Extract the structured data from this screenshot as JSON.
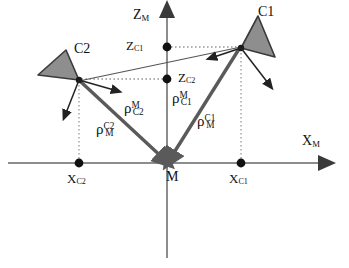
{
  "figure": {
    "type": "geometry-diagram",
    "axes": {
      "vertical_label": "Z",
      "vertical_sub": "M",
      "horizontal_label": "X",
      "horizontal_sub": "M"
    },
    "points": {
      "origin": "M",
      "z_c1": {
        "base": "Z",
        "sub": "C1"
      },
      "z_c2": {
        "base": "Z",
        "sub": "C2"
      },
      "x_c1": {
        "base": "X",
        "sub": "C1"
      },
      "x_c2": {
        "base": "X",
        "sub": "C2"
      }
    },
    "cameras": [
      {
        "name": "C1",
        "label": "C1"
      },
      {
        "name": "C2",
        "label": "C2"
      }
    ],
    "vectors": [
      {
        "id": "rho-M-C2",
        "base": "ρ",
        "sup": "M",
        "sub": "C2"
      },
      {
        "id": "rho-C2-M",
        "base": "ρ",
        "sup": "C2",
        "sub": "M"
      },
      {
        "id": "rho-M-C1",
        "base": "ρ",
        "sup": "M",
        "sub": "C1"
      },
      {
        "id": "rho-C1-M",
        "base": "ρ",
        "sup": "C1",
        "sub": "M"
      }
    ],
    "colors": {
      "axis": "#8d8d8d",
      "vector": "#5a5a5a",
      "camera_fill": "#8e8e8e",
      "camera_stroke": "#3a3a3a",
      "dotted": "#9a9a9a",
      "text": "#111111"
    }
  }
}
